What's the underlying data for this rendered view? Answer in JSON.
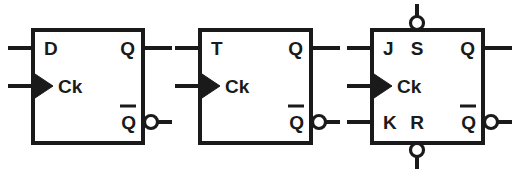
{
  "diagram": {
    "stroke_color": "#1a1a1a",
    "background_color": "#ffffff",
    "symbols": [
      {
        "id": "d-flip-flop",
        "type": "D flip-flop",
        "box": {
          "x": 33,
          "y": 30,
          "width": 110,
          "height": 113
        },
        "pins": [
          {
            "name": "d-input",
            "label": "D",
            "side": "left",
            "y": 48,
            "inverted": false,
            "clock": false
          },
          {
            "name": "clock-input",
            "label": "Ck",
            "side": "left",
            "y": 86,
            "inverted": false,
            "clock": true
          },
          {
            "name": "q-output",
            "label": "Q",
            "side": "right",
            "y": 48,
            "inverted": false,
            "clock": false
          },
          {
            "name": "q-not-output",
            "label": "Q",
            "side": "right",
            "y": 122,
            "inverted": true,
            "clock": false
          }
        ]
      },
      {
        "id": "t-flip-flop",
        "type": "T flip-flop",
        "box": {
          "x": 200,
          "y": 30,
          "width": 111,
          "height": 113
        },
        "pins": [
          {
            "name": "t-input",
            "label": "T",
            "side": "left",
            "y": 48,
            "inverted": false,
            "clock": false
          },
          {
            "name": "clock-input",
            "label": "Ck",
            "side": "left",
            "y": 86,
            "inverted": false,
            "clock": true
          },
          {
            "name": "q-output",
            "label": "Q",
            "side": "right",
            "y": 48,
            "inverted": false,
            "clock": false
          },
          {
            "name": "q-not-output",
            "label": "Q",
            "side": "right",
            "y": 122,
            "inverted": true,
            "clock": false
          }
        ]
      },
      {
        "id": "jk-flip-flop",
        "type": "JK flip-flop",
        "box": {
          "x": 372,
          "y": 30,
          "width": 111,
          "height": 113
        },
        "pins": [
          {
            "name": "j-input",
            "label": "J",
            "side": "left",
            "y": 48,
            "inverted": false,
            "clock": false
          },
          {
            "name": "clock-input",
            "label": "Ck",
            "side": "left",
            "y": 86,
            "inverted": false,
            "clock": true
          },
          {
            "name": "k-input",
            "label": "K",
            "side": "left",
            "y": 122,
            "inverted": false,
            "clock": false
          },
          {
            "name": "set-input",
            "label": "S",
            "side": "top",
            "x": 417,
            "inverted": true,
            "clock": false
          },
          {
            "name": "reset-input",
            "label": "R",
            "side": "bottom",
            "x": 417,
            "inverted": true,
            "clock": false
          },
          {
            "name": "q-output",
            "label": "Q",
            "side": "right",
            "y": 48,
            "inverted": false,
            "clock": false
          },
          {
            "name": "q-not-output",
            "label": "Q",
            "side": "right",
            "y": 122,
            "inverted": true,
            "clock": false
          }
        ]
      }
    ]
  }
}
